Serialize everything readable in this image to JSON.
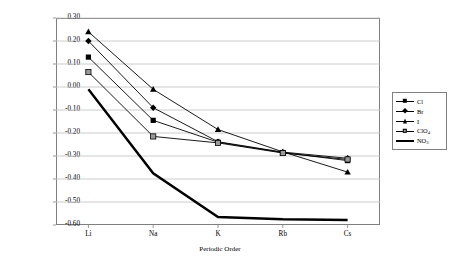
{
  "chart_data": {
    "type": "line",
    "title": "",
    "xlabel": "Periodic Order",
    "ylabel": "log γ",
    "categories": [
      "Li",
      "Na",
      "K",
      "Rb",
      "Cs"
    ],
    "ylim": [
      -0.6,
      0.3
    ],
    "ytick_step": 0.1,
    "yticks": [
      "0.30",
      "0.20",
      "0.10",
      "0.00",
      "-0.10",
      "-0.20",
      "-0.30",
      "-0.40",
      "-0.50",
      "-0.60"
    ],
    "grid": "horizontal",
    "legend_position": "right",
    "series": [
      {
        "name": "Cl",
        "marker": "square",
        "values": [
          0.13,
          -0.145,
          -0.24,
          -0.285,
          -0.32
        ]
      },
      {
        "name": "Br",
        "marker": "diamond",
        "values": [
          0.2,
          -0.09,
          -0.238,
          -0.283,
          -0.31
        ]
      },
      {
        "name": "I",
        "marker": "triangle",
        "values": [
          0.24,
          -0.01,
          -0.185,
          -0.282,
          -0.37
        ]
      },
      {
        "name": "ClO4",
        "marker": "square-outline",
        "values": [
          0.065,
          -0.215,
          -0.243,
          -0.287,
          -0.315
        ]
      },
      {
        "name": "NO3",
        "marker": "none",
        "values": [
          -0.01,
          -0.375,
          -0.565,
          -0.575,
          -0.578
        ]
      }
    ]
  },
  "legend": {
    "items": [
      {
        "label_main": "Cl",
        "label_sub": ""
      },
      {
        "label_main": "Br",
        "label_sub": ""
      },
      {
        "label_main": "I",
        "label_sub": ""
      },
      {
        "label_main": "ClO",
        "label_sub": "4"
      },
      {
        "label_main": "NO",
        "label_sub": "3"
      }
    ]
  },
  "colors": {
    "line": "#000000",
    "grid": "#bfbfbf",
    "frame": "#7f7f7f",
    "background": "#ffffff"
  }
}
